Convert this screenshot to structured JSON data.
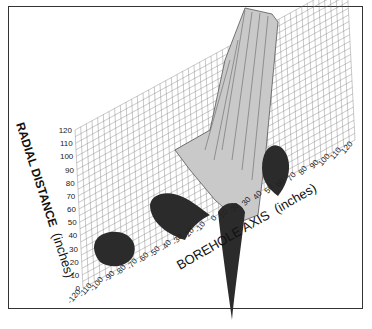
{
  "chart_data": {
    "type": "surface3d",
    "title": "",
    "xlabel": "BOREHOLE AXIS (inches)",
    "ylabel": "RADIAL DISTANCE (inches)",
    "x_ticks": [
      "-120",
      "-110",
      "-100",
      "-90",
      "-80",
      "-70",
      "-60",
      "-50",
      "-40",
      "-30",
      "-20",
      "-10",
      "0",
      "10",
      "20",
      "30",
      "40",
      "50",
      "60",
      "70",
      "80",
      "90",
      "100",
      "110",
      "120"
    ],
    "y_ticks": [
      "0",
      "10",
      "20",
      "30",
      "40",
      "50",
      "60",
      "70",
      "80",
      "90",
      "100",
      "110",
      "120"
    ],
    "xlim": [
      -120,
      120
    ],
    "ylim": [
      0,
      120
    ],
    "grid": true,
    "features": [
      {
        "name": "tall peak",
        "approx_x": 0,
        "approx_y": 10,
        "description": "large light-gray ridge rising near borehole axis origin"
      },
      {
        "name": "dark lobe 1",
        "approx_x": -100,
        "approx_y": 20
      },
      {
        "name": "dark lobe 2",
        "approx_x": -60,
        "approx_y": 50
      },
      {
        "name": "dark spike",
        "approx_x": -20,
        "approx_y": 0
      },
      {
        "name": "dark lobe 3",
        "approx_x": 30,
        "approx_y": 40
      }
    ]
  },
  "labels": {
    "radial_axis": "RADIAL DISTANCE (inches)",
    "radial_part1": "RADIAL DISTANCE",
    "radial_part2": "(inches)",
    "borehole_axis": "BOREHOLE AXIS (inches)",
    "borehole_part1": "BOREHOLE AXIS",
    "borehole_part2": "(inches)"
  }
}
